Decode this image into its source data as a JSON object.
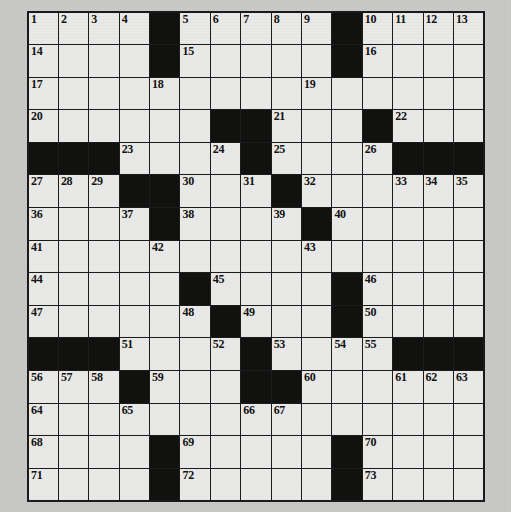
{
  "puzzle": {
    "title": "Crossword Puzzle Grid",
    "rows": 15,
    "cols": 15,
    "colors": {
      "white_cell": "#e9e9e7",
      "black_cell": "#111110",
      "grid_line": "#1c1c1c",
      "page_background": "#c9c9c7",
      "number_text": "#121212"
    },
    "grid": [
      [
        {
          "type": "white",
          "num": "1"
        },
        {
          "type": "white",
          "num": "2"
        },
        {
          "type": "white",
          "num": "3"
        },
        {
          "type": "white",
          "num": "4"
        },
        {
          "type": "black",
          "num": ""
        },
        {
          "type": "white",
          "num": "5"
        },
        {
          "type": "white",
          "num": "6"
        },
        {
          "type": "white",
          "num": "7"
        },
        {
          "type": "white",
          "num": "8"
        },
        {
          "type": "white",
          "num": "9"
        },
        {
          "type": "black",
          "num": ""
        },
        {
          "type": "white",
          "num": "10"
        },
        {
          "type": "white",
          "num": "11"
        },
        {
          "type": "white",
          "num": "12"
        },
        {
          "type": "white",
          "num": "13"
        }
      ],
      [
        {
          "type": "white",
          "num": "14"
        },
        {
          "type": "white",
          "num": ""
        },
        {
          "type": "white",
          "num": ""
        },
        {
          "type": "white",
          "num": ""
        },
        {
          "type": "black",
          "num": ""
        },
        {
          "type": "white",
          "num": "15"
        },
        {
          "type": "white",
          "num": ""
        },
        {
          "type": "white",
          "num": ""
        },
        {
          "type": "white",
          "num": ""
        },
        {
          "type": "white",
          "num": ""
        },
        {
          "type": "black",
          "num": ""
        },
        {
          "type": "white",
          "num": "16"
        },
        {
          "type": "white",
          "num": ""
        },
        {
          "type": "white",
          "num": ""
        },
        {
          "type": "white",
          "num": ""
        }
      ],
      [
        {
          "type": "white",
          "num": "17"
        },
        {
          "type": "white",
          "num": ""
        },
        {
          "type": "white",
          "num": ""
        },
        {
          "type": "white",
          "num": ""
        },
        {
          "type": "white",
          "num": "18"
        },
        {
          "type": "white",
          "num": ""
        },
        {
          "type": "white",
          "num": ""
        },
        {
          "type": "white",
          "num": ""
        },
        {
          "type": "white",
          "num": ""
        },
        {
          "type": "white",
          "num": "19"
        },
        {
          "type": "white",
          "num": ""
        },
        {
          "type": "white",
          "num": ""
        },
        {
          "type": "white",
          "num": ""
        },
        {
          "type": "white",
          "num": ""
        },
        {
          "type": "white",
          "num": ""
        }
      ],
      [
        {
          "type": "white",
          "num": "20"
        },
        {
          "type": "white",
          "num": ""
        },
        {
          "type": "white",
          "num": ""
        },
        {
          "type": "white",
          "num": ""
        },
        {
          "type": "white",
          "num": ""
        },
        {
          "type": "white",
          "num": ""
        },
        {
          "type": "black",
          "num": ""
        },
        {
          "type": "black",
          "num": ""
        },
        {
          "type": "white",
          "num": "21"
        },
        {
          "type": "white",
          "num": ""
        },
        {
          "type": "white",
          "num": ""
        },
        {
          "type": "black",
          "num": ""
        },
        {
          "type": "white",
          "num": "22"
        },
        {
          "type": "white",
          "num": ""
        },
        {
          "type": "white",
          "num": ""
        }
      ],
      [
        {
          "type": "black",
          "num": ""
        },
        {
          "type": "black",
          "num": ""
        },
        {
          "type": "black",
          "num": ""
        },
        {
          "type": "white",
          "num": "23"
        },
        {
          "type": "white",
          "num": ""
        },
        {
          "type": "white",
          "num": ""
        },
        {
          "type": "white",
          "num": "24"
        },
        {
          "type": "black",
          "num": ""
        },
        {
          "type": "white",
          "num": "25"
        },
        {
          "type": "white",
          "num": ""
        },
        {
          "type": "white",
          "num": ""
        },
        {
          "type": "white",
          "num": "26"
        },
        {
          "type": "black",
          "num": ""
        },
        {
          "type": "black",
          "num": ""
        },
        {
          "type": "black",
          "num": ""
        }
      ],
      [
        {
          "type": "white",
          "num": "27"
        },
        {
          "type": "white",
          "num": "28"
        },
        {
          "type": "white",
          "num": "29"
        },
        {
          "type": "black",
          "num": ""
        },
        {
          "type": "black",
          "num": ""
        },
        {
          "type": "white",
          "num": "30"
        },
        {
          "type": "white",
          "num": ""
        },
        {
          "type": "white",
          "num": "31"
        },
        {
          "type": "black",
          "num": ""
        },
        {
          "type": "white",
          "num": "32"
        },
        {
          "type": "white",
          "num": ""
        },
        {
          "type": "white",
          "num": ""
        },
        {
          "type": "white",
          "num": "33"
        },
        {
          "type": "white",
          "num": "34"
        },
        {
          "type": "white",
          "num": "35"
        }
      ],
      [
        {
          "type": "white",
          "num": "36"
        },
        {
          "type": "white",
          "num": ""
        },
        {
          "type": "white",
          "num": ""
        },
        {
          "type": "white",
          "num": "37"
        },
        {
          "type": "black",
          "num": ""
        },
        {
          "type": "white",
          "num": "38"
        },
        {
          "type": "white",
          "num": ""
        },
        {
          "type": "white",
          "num": ""
        },
        {
          "type": "white",
          "num": "39"
        },
        {
          "type": "black",
          "num": ""
        },
        {
          "type": "white",
          "num": "40"
        },
        {
          "type": "white",
          "num": ""
        },
        {
          "type": "white",
          "num": ""
        },
        {
          "type": "white",
          "num": ""
        },
        {
          "type": "white",
          "num": ""
        }
      ],
      [
        {
          "type": "white",
          "num": "41"
        },
        {
          "type": "white",
          "num": ""
        },
        {
          "type": "white",
          "num": ""
        },
        {
          "type": "white",
          "num": ""
        },
        {
          "type": "white",
          "num": "42"
        },
        {
          "type": "white",
          "num": ""
        },
        {
          "type": "white",
          "num": ""
        },
        {
          "type": "white",
          "num": ""
        },
        {
          "type": "white",
          "num": ""
        },
        {
          "type": "white",
          "num": "43"
        },
        {
          "type": "white",
          "num": ""
        },
        {
          "type": "white",
          "num": ""
        },
        {
          "type": "white",
          "num": ""
        },
        {
          "type": "white",
          "num": ""
        },
        {
          "type": "white",
          "num": ""
        }
      ],
      [
        {
          "type": "white",
          "num": "44"
        },
        {
          "type": "white",
          "num": ""
        },
        {
          "type": "white",
          "num": ""
        },
        {
          "type": "white",
          "num": ""
        },
        {
          "type": "white",
          "num": ""
        },
        {
          "type": "black",
          "num": ""
        },
        {
          "type": "white",
          "num": "45"
        },
        {
          "type": "white",
          "num": ""
        },
        {
          "type": "white",
          "num": ""
        },
        {
          "type": "white",
          "num": ""
        },
        {
          "type": "black",
          "num": ""
        },
        {
          "type": "white",
          "num": "46"
        },
        {
          "type": "white",
          "num": ""
        },
        {
          "type": "white",
          "num": ""
        },
        {
          "type": "white",
          "num": ""
        }
      ],
      [
        {
          "type": "white",
          "num": "47"
        },
        {
          "type": "white",
          "num": ""
        },
        {
          "type": "white",
          "num": ""
        },
        {
          "type": "white",
          "num": ""
        },
        {
          "type": "white",
          "num": ""
        },
        {
          "type": "white",
          "num": "48"
        },
        {
          "type": "black",
          "num": ""
        },
        {
          "type": "white",
          "num": "49"
        },
        {
          "type": "white",
          "num": ""
        },
        {
          "type": "white",
          "num": ""
        },
        {
          "type": "black",
          "num": ""
        },
        {
          "type": "white",
          "num": "50"
        },
        {
          "type": "white",
          "num": ""
        },
        {
          "type": "white",
          "num": ""
        },
        {
          "type": "white",
          "num": ""
        }
      ],
      [
        {
          "type": "black",
          "num": ""
        },
        {
          "type": "black",
          "num": ""
        },
        {
          "type": "black",
          "num": ""
        },
        {
          "type": "white",
          "num": "51"
        },
        {
          "type": "white",
          "num": ""
        },
        {
          "type": "white",
          "num": ""
        },
        {
          "type": "white",
          "num": "52"
        },
        {
          "type": "black",
          "num": ""
        },
        {
          "type": "white",
          "num": "53"
        },
        {
          "type": "white",
          "num": ""
        },
        {
          "type": "white",
          "num": "54"
        },
        {
          "type": "white",
          "num": "55"
        },
        {
          "type": "black",
          "num": ""
        },
        {
          "type": "black",
          "num": ""
        },
        {
          "type": "black",
          "num": ""
        }
      ],
      [
        {
          "type": "white",
          "num": "56"
        },
        {
          "type": "white",
          "num": "57"
        },
        {
          "type": "white",
          "num": "58"
        },
        {
          "type": "black",
          "num": ""
        },
        {
          "type": "white",
          "num": "59"
        },
        {
          "type": "white",
          "num": ""
        },
        {
          "type": "white",
          "num": ""
        },
        {
          "type": "black",
          "num": ""
        },
        {
          "type": "black",
          "num": ""
        },
        {
          "type": "white",
          "num": "60"
        },
        {
          "type": "white",
          "num": ""
        },
        {
          "type": "white",
          "num": ""
        },
        {
          "type": "white",
          "num": "61"
        },
        {
          "type": "white",
          "num": "62"
        },
        {
          "type": "white",
          "num": "63"
        }
      ],
      [
        {
          "type": "white",
          "num": "64"
        },
        {
          "type": "white",
          "num": ""
        },
        {
          "type": "white",
          "num": ""
        },
        {
          "type": "white",
          "num": "65"
        },
        {
          "type": "white",
          "num": ""
        },
        {
          "type": "white",
          "num": ""
        },
        {
          "type": "white",
          "num": ""
        },
        {
          "type": "white",
          "num": "66"
        },
        {
          "type": "white",
          "num": "67"
        },
        {
          "type": "white",
          "num": ""
        },
        {
          "type": "white",
          "num": ""
        },
        {
          "type": "white",
          "num": ""
        },
        {
          "type": "white",
          "num": ""
        },
        {
          "type": "white",
          "num": ""
        },
        {
          "type": "white",
          "num": ""
        }
      ],
      [
        {
          "type": "white",
          "num": "68"
        },
        {
          "type": "white",
          "num": ""
        },
        {
          "type": "white",
          "num": ""
        },
        {
          "type": "white",
          "num": ""
        },
        {
          "type": "black",
          "num": ""
        },
        {
          "type": "white",
          "num": "69"
        },
        {
          "type": "white",
          "num": ""
        },
        {
          "type": "white",
          "num": ""
        },
        {
          "type": "white",
          "num": ""
        },
        {
          "type": "white",
          "num": ""
        },
        {
          "type": "black",
          "num": ""
        },
        {
          "type": "white",
          "num": "70"
        },
        {
          "type": "white",
          "num": ""
        },
        {
          "type": "white",
          "num": ""
        },
        {
          "type": "white",
          "num": ""
        }
      ],
      [
        {
          "type": "white",
          "num": "71"
        },
        {
          "type": "white",
          "num": ""
        },
        {
          "type": "white",
          "num": ""
        },
        {
          "type": "white",
          "num": ""
        },
        {
          "type": "black",
          "num": ""
        },
        {
          "type": "white",
          "num": "72"
        },
        {
          "type": "white",
          "num": ""
        },
        {
          "type": "white",
          "num": ""
        },
        {
          "type": "white",
          "num": ""
        },
        {
          "type": "white",
          "num": ""
        },
        {
          "type": "black",
          "num": ""
        },
        {
          "type": "white",
          "num": "73"
        },
        {
          "type": "white",
          "num": ""
        },
        {
          "type": "white",
          "num": ""
        },
        {
          "type": "white",
          "num": ""
        }
      ]
    ]
  }
}
